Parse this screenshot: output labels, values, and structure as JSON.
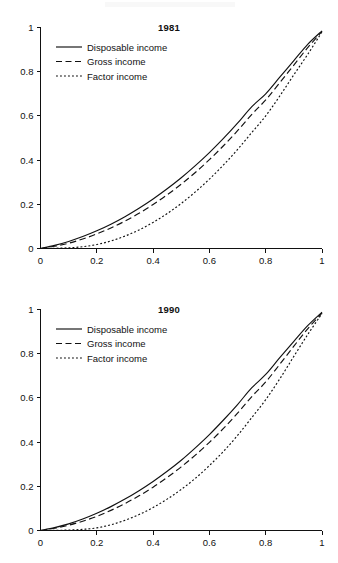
{
  "figure": {
    "panel_count": 2,
    "shared_legend_entries": [
      "Disposable income",
      "Gross income",
      "Factor income"
    ],
    "line_styles": [
      "solid",
      "dashed",
      "dotted"
    ]
  },
  "panels": [
    {
      "id": "panel-1981",
      "title": "1981"
    },
    {
      "id": "panel-1990",
      "title": "1990"
    }
  ],
  "axis": {
    "x_tick_labels": [
      "0",
      "0.2",
      "0.4",
      "0.6",
      "0.8",
      "1"
    ],
    "y_tick_labels": [
      "0",
      "0.2",
      "0.4",
      "0.6",
      "0.8",
      "1"
    ],
    "x_tick_values": [
      0,
      0.2,
      0.4,
      0.6,
      0.8,
      1
    ],
    "y_tick_values": [
      0,
      0.2,
      0.4,
      0.6,
      0.8,
      1
    ]
  },
  "chart_data": [
    {
      "type": "line",
      "title": "1981",
      "xlabel": "",
      "ylabel": "",
      "xlim": [
        0,
        1
      ],
      "ylim": [
        0,
        1
      ],
      "grid": false,
      "legend_position": "upper-left-inside",
      "x": [
        0,
        0.05,
        0.1,
        0.15,
        0.2,
        0.25,
        0.3,
        0.35,
        0.4,
        0.45,
        0.5,
        0.55,
        0.6,
        0.65,
        0.7,
        0.75,
        0.8,
        0.85,
        0.9,
        0.95,
        1
      ],
      "series": [
        {
          "name": "Disposable income",
          "style": "solid",
          "values": [
            0,
            0.014,
            0.032,
            0.054,
            0.08,
            0.11,
            0.144,
            0.182,
            0.224,
            0.27,
            0.32,
            0.375,
            0.434,
            0.498,
            0.567,
            0.641,
            0.7,
            0.775,
            0.85,
            0.925,
            0.985
          ]
        },
        {
          "name": "Gross income",
          "style": "dashed",
          "values": [
            0,
            0.01,
            0.024,
            0.043,
            0.066,
            0.093,
            0.124,
            0.159,
            0.199,
            0.243,
            0.291,
            0.344,
            0.402,
            0.465,
            0.533,
            0.606,
            0.672,
            0.75,
            0.83,
            0.91,
            0.982
          ]
        },
        {
          "name": "Factor income",
          "style": "dotted",
          "values": [
            0,
            0.001,
            0.003,
            0.008,
            0.018,
            0.034,
            0.056,
            0.084,
            0.118,
            0.158,
            0.204,
            0.256,
            0.314,
            0.378,
            0.448,
            0.524,
            0.6,
            0.69,
            0.786,
            0.88,
            0.98
          ]
        }
      ]
    },
    {
      "type": "line",
      "title": "1990",
      "xlabel": "",
      "ylabel": "",
      "xlim": [
        0,
        1
      ],
      "ylim": [
        0,
        1
      ],
      "grid": false,
      "legend_position": "upper-left-inside",
      "x": [
        0,
        0.05,
        0.1,
        0.15,
        0.2,
        0.25,
        0.3,
        0.35,
        0.4,
        0.45,
        0.5,
        0.55,
        0.6,
        0.65,
        0.7,
        0.75,
        0.8,
        0.85,
        0.9,
        0.95,
        1
      ],
      "series": [
        {
          "name": "Disposable income",
          "style": "solid",
          "values": [
            0,
            0.013,
            0.03,
            0.052,
            0.078,
            0.108,
            0.142,
            0.18,
            0.222,
            0.268,
            0.318,
            0.374,
            0.434,
            0.5,
            0.57,
            0.645,
            0.706,
            0.782,
            0.856,
            0.928,
            0.988
          ]
        },
        {
          "name": "Gross income",
          "style": "dashed",
          "values": [
            0,
            0.01,
            0.024,
            0.042,
            0.064,
            0.091,
            0.122,
            0.157,
            0.196,
            0.24,
            0.288,
            0.341,
            0.399,
            0.462,
            0.531,
            0.605,
            0.672,
            0.752,
            0.834,
            0.914,
            0.984
          ]
        },
        {
          "name": "Factor income",
          "style": "dotted",
          "values": [
            0,
            0.0005,
            0.002,
            0.005,
            0.012,
            0.026,
            0.046,
            0.072,
            0.104,
            0.142,
            0.186,
            0.236,
            0.294,
            0.358,
            0.43,
            0.51,
            0.592,
            0.686,
            0.788,
            0.888,
            0.982
          ]
        }
      ]
    }
  ]
}
